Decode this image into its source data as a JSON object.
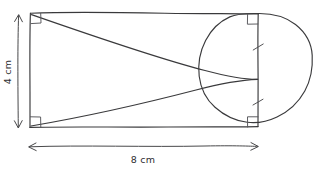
{
  "figure": {
    "ink_color": "#3a3a3c",
    "background_color": "#ffffff",
    "dimensions": {
      "height": {
        "name": "height-dimension",
        "value": "4",
        "unit": "cm",
        "text": "4 cm",
        "orientation": "vertical"
      },
      "width": {
        "name": "width-dimension",
        "value": "8",
        "unit": "cm",
        "text": "8 cm",
        "orientation": "horizontal"
      }
    },
    "shapes": [
      {
        "name": "rectangle",
        "label": "rectangle"
      },
      {
        "name": "circle",
        "label": "circle"
      },
      {
        "name": "triangle",
        "label": "triangle"
      }
    ],
    "marks": {
      "right_angles": 4,
      "congruence_ticks": 2
    }
  }
}
